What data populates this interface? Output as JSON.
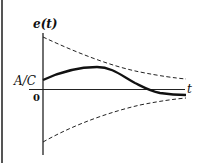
{
  "diagram": {
    "y_axis_label": "e(t)",
    "x_axis_label": "t",
    "y_tick_label": "A/C",
    "origin_label": "0",
    "curves": [
      {
        "name": "response",
        "style": "solid",
        "description": "starts at A/C, rises to a peak, decays through zero to slightly negative"
      },
      {
        "name": "upper-envelope",
        "style": "dashed",
        "description": "decaying from large positive toward axis"
      },
      {
        "name": "lower-envelope",
        "style": "dashed",
        "description": "rising from large negative toward axis"
      }
    ],
    "colors": {
      "line": "#111111",
      "border": "#555555",
      "background": "#ffffff"
    }
  }
}
